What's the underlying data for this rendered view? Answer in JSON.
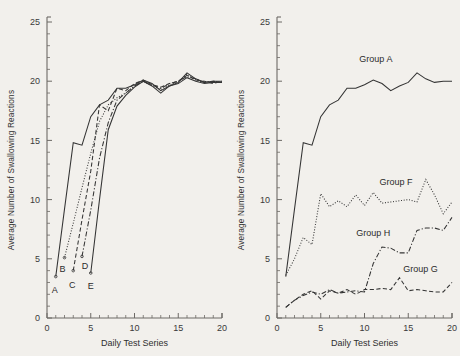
{
  "figure": {
    "background_color": "#f2f0ec",
    "ink_color": "#343434",
    "axis_color": "#6d6a66"
  },
  "panels": {
    "left": {
      "name": "left-panel",
      "xlabel": "Daily Test Series",
      "ylabel": "Average Number of Swallowing Reactions",
      "xticklabels": [
        "0",
        "5",
        "10",
        "15",
        "20"
      ],
      "yticklabels": [
        "0",
        "5",
        "10",
        "15",
        "20",
        "25"
      ],
      "curve_labels": [
        "A",
        "B",
        "C",
        "D",
        "E"
      ]
    },
    "right": {
      "name": "right-panel",
      "xlabel": "Daily Test Series",
      "ylabel": "Average Number of Swallowing Reactions",
      "xticklabels": [
        "0",
        "5",
        "10",
        "15",
        "20"
      ],
      "yticklabels": [
        "0",
        "5",
        "10",
        "15",
        "20",
        "25"
      ],
      "series_labels": [
        "Group A",
        "Group F",
        "Group H",
        "Group G"
      ]
    }
  },
  "chart_data": [
    {
      "type": "line",
      "panel": "left",
      "title": "",
      "xlabel": "Daily Test Series",
      "ylabel": "Average Number of Swallowing Reactions",
      "xlim": [
        0,
        20
      ],
      "ylim": [
        0,
        25
      ],
      "xticks": [
        0,
        5,
        10,
        15,
        20
      ],
      "yticks": [
        0,
        5,
        10,
        15,
        20,
        25
      ],
      "xticks_minor_step": 1,
      "yticks_minor_step": 1,
      "grid": false,
      "legend": "inline-end-labels",
      "series": [
        {
          "name": "A",
          "label": "A",
          "linestyle": "solid",
          "x": [
            1,
            2,
            3,
            4,
            5,
            6,
            7,
            8,
            9,
            10,
            11,
            12,
            13,
            14,
            15,
            16,
            17,
            18,
            19,
            20
          ],
          "values": [
            3.5,
            9.2,
            14.8,
            14.6,
            17.0,
            18.0,
            18.4,
            19.4,
            19.4,
            19.7,
            20.1,
            19.8,
            19.2,
            19.6,
            19.9,
            20.7,
            20.2,
            19.9,
            20.0,
            20.0
          ]
        },
        {
          "name": "B",
          "label": "B",
          "linestyle": "dotted",
          "x": [
            2,
            3,
            4,
            5,
            6,
            7,
            8,
            9,
            10,
            11,
            12,
            13,
            14,
            15,
            16,
            17,
            18,
            19,
            20
          ],
          "values": [
            5.1,
            8.0,
            11.0,
            13.9,
            16.6,
            18.0,
            18.6,
            19.0,
            19.6,
            20.0,
            19.6,
            19.3,
            19.7,
            19.9,
            20.6,
            20.1,
            19.9,
            20.0,
            19.9
          ]
        },
        {
          "name": "C",
          "label": "C",
          "linestyle": "dashed",
          "x": [
            3,
            4,
            5,
            6,
            7,
            8,
            9,
            10,
            11,
            12,
            13,
            14,
            15,
            16,
            17,
            18,
            19,
            20
          ],
          "values": [
            4.0,
            8.3,
            12.4,
            18.0,
            17.5,
            19.4,
            19.2,
            19.8,
            20.1,
            19.7,
            19.5,
            19.8,
            20.0,
            20.5,
            20.1,
            20.0,
            19.8,
            20.0
          ]
        },
        {
          "name": "D",
          "label": "D",
          "linestyle": "dashdot",
          "x": [
            4,
            5,
            6,
            7,
            8,
            9,
            10,
            11,
            12,
            13,
            14,
            15,
            16,
            17,
            18,
            19,
            20
          ],
          "values": [
            5.2,
            9.1,
            13.5,
            16.5,
            18.4,
            19.0,
            19.6,
            20.0,
            19.7,
            19.4,
            19.8,
            20.0,
            20.4,
            20.2,
            19.9,
            20.0,
            19.9
          ]
        },
        {
          "name": "E",
          "label": "E",
          "linestyle": "solid",
          "x": [
            5,
            6,
            7,
            8,
            9,
            10,
            11,
            12,
            13,
            14,
            15,
            16,
            17,
            18,
            19,
            20
          ],
          "values": [
            3.8,
            10.0,
            15.9,
            17.9,
            18.8,
            19.5,
            20.0,
            19.6,
            19.0,
            19.6,
            19.8,
            20.3,
            20.0,
            19.8,
            19.9,
            19.9
          ]
        }
      ]
    },
    {
      "type": "line",
      "panel": "right",
      "title": "",
      "xlabel": "Daily Test Series",
      "ylabel": "Average Number of Swallowing Reactions",
      "xlim": [
        0,
        20
      ],
      "ylim": [
        0,
        25
      ],
      "xticks": [
        0,
        5,
        10,
        15,
        20
      ],
      "yticks": [
        0,
        5,
        10,
        15,
        20,
        25
      ],
      "xticks_minor_step": 1,
      "yticks_minor_step": 1,
      "grid": false,
      "legend": "inline-labels",
      "series": [
        {
          "name": "Group A",
          "label": "Group A",
          "linestyle": "solid",
          "x": [
            1,
            2,
            3,
            4,
            5,
            6,
            7,
            8,
            9,
            10,
            11,
            12,
            13,
            14,
            15,
            16,
            17,
            18,
            19,
            20
          ],
          "values": [
            3.5,
            9.2,
            14.8,
            14.6,
            17.0,
            18.0,
            18.4,
            19.4,
            19.4,
            19.7,
            20.1,
            19.8,
            19.2,
            19.6,
            19.9,
            20.7,
            20.2,
            19.9,
            20.0,
            20.0
          ]
        },
        {
          "name": "Group F",
          "label": "Group F",
          "linestyle": "dotted",
          "x": [
            1,
            2,
            3,
            4,
            5,
            6,
            7,
            8,
            9,
            10,
            11,
            12,
            13,
            14,
            15,
            16,
            17,
            18,
            19,
            20
          ],
          "values": [
            3.6,
            5.0,
            6.8,
            6.2,
            10.5,
            9.4,
            9.9,
            9.4,
            10.4,
            9.5,
            10.6,
            9.7,
            9.8,
            9.9,
            10.0,
            9.8,
            11.7,
            10.4,
            8.8,
            9.8
          ]
        },
        {
          "name": "Group H",
          "label": "Group H",
          "linestyle": "dashdot",
          "x": [
            1,
            2,
            3,
            4,
            5,
            6,
            7,
            8,
            9,
            10,
            11,
            12,
            13,
            14,
            15,
            16,
            17,
            18,
            19,
            20
          ],
          "values": [
            0.9,
            1.5,
            1.9,
            2.2,
            2.0,
            2.4,
            2.1,
            2.2,
            2.3,
            2.2,
            4.6,
            6.0,
            5.9,
            5.5,
            5.5,
            7.4,
            7.6,
            7.6,
            7.4,
            8.5
          ]
        },
        {
          "name": "Group G",
          "label": "Group G",
          "linestyle": "dashed",
          "x": [
            1,
            2,
            3,
            4,
            5,
            6,
            7,
            8,
            9,
            10,
            11,
            12,
            13,
            14,
            15,
            16,
            17,
            18,
            19,
            20
          ],
          "values": [
            0.9,
            1.5,
            2.0,
            2.3,
            1.6,
            2.3,
            2.1,
            2.4,
            2.0,
            2.4,
            2.4,
            2.5,
            2.4,
            3.4,
            2.3,
            2.4,
            2.3,
            2.2,
            2.2,
            3.0
          ]
        }
      ]
    }
  ]
}
